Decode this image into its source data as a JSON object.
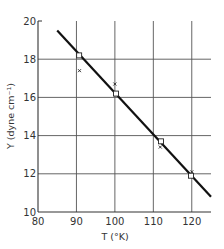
{
  "chart_data": {
    "type": "scatter",
    "title": "",
    "xlabel": "T (°K)",
    "ylabel": "Y (dyne cm⁻¹)",
    "xlim": [
      80,
      125
    ],
    "ylim": [
      10,
      20
    ],
    "xticks": [
      80,
      90,
      100,
      110,
      120
    ],
    "yticks": [
      10,
      12,
      14,
      16,
      18,
      20
    ],
    "x_tick_labels": [
      "80",
      "90",
      "100",
      "110",
      "120"
    ],
    "y_tick_labels": [
      "10",
      "12",
      "14",
      "16",
      "18",
      "20"
    ],
    "grid": true,
    "legend": null,
    "series": [
      {
        "name": "fit line",
        "kind": "line",
        "x": [
          85,
          125
        ],
        "y": [
          19.5,
          10.8
        ]
      },
      {
        "name": "squares",
        "kind": "marker-square",
        "x": [
          90.7,
          100.3,
          112,
          119.8
        ],
        "y": [
          18.2,
          16.2,
          13.7,
          11.9
        ]
      },
      {
        "name": "crosses",
        "kind": "marker-cross",
        "x": [
          90.8,
          100,
          111.8,
          120
        ],
        "y": [
          17.4,
          16.7,
          13.4,
          12.1
        ]
      }
    ]
  }
}
